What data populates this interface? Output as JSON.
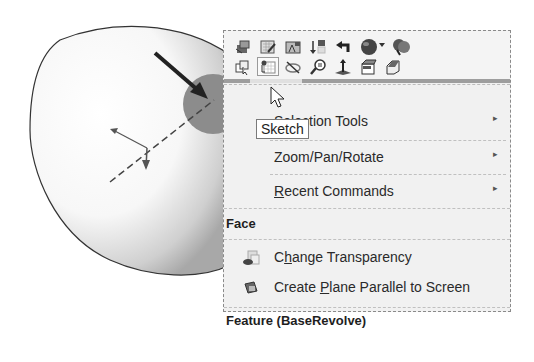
{
  "viewport": {
    "model": "revolved-body",
    "selected_face_highlight": "#8a8a8a"
  },
  "context_toolbar": {
    "row1": [
      {
        "icon": "zoom-to-selection-icon"
      },
      {
        "icon": "edit-sketch-icon"
      },
      {
        "icon": "edit-feature-icon"
      },
      {
        "icon": "rollback-icon"
      },
      {
        "icon": "parent-child-icon"
      },
      {
        "icon": "appearance-icon"
      },
      {
        "icon": "appearance-callout-icon"
      }
    ],
    "row2": [
      {
        "icon": "select-other-icon"
      },
      {
        "icon": "sketch-icon",
        "active": true
      },
      {
        "icon": "hide-icon"
      },
      {
        "icon": "zoom-to-selection-search-icon"
      },
      {
        "icon": "normal-to-icon"
      },
      {
        "icon": "isolate-icon"
      },
      {
        "icon": "view-orientation-icon"
      }
    ]
  },
  "tooltip": "Sketch",
  "menu": {
    "items_top": [
      {
        "label": "Selection Tools",
        "visible_label": "on Tools",
        "has_submenu": true
      },
      {
        "label": "Zoom/Pan/Rotate",
        "has_submenu": true
      },
      {
        "label": "Recent Commands",
        "accel": "R",
        "rest": "ecent Commands",
        "has_submenu": true
      }
    ],
    "face_header": "Face",
    "face_items": [
      {
        "pre": "C",
        "accel": "h",
        "post": "ange Transparency",
        "icon": "change-transparency-icon"
      },
      {
        "pre": "Create ",
        "accel": "P",
        "post": "lane Parallel to Screen",
        "icon": "create-plane-icon"
      }
    ],
    "feature_header": "Feature (BaseRevolve)",
    "submenu_arrow": "▸"
  }
}
